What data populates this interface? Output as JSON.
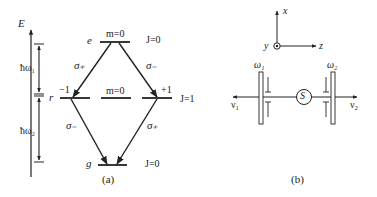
{
  "panel_a": {
    "energy_axis_label": "E",
    "interval_upper_label": "ħω₁",
    "interval_lower_label": "ħω₂",
    "level_e": {
      "name": "e",
      "m_label": "m=0",
      "J_label": "J=0"
    },
    "level_r": {
      "name": "r",
      "m_minus_label": "−1",
      "m_zero_label": "m=0",
      "m_plus_label": "+1",
      "J_label": "J=1"
    },
    "level_g": {
      "name": "g",
      "J_label": "J=0"
    },
    "transitions": {
      "upper_left": "σ₊",
      "upper_right": "σ₋",
      "lower_left": "σ₋",
      "lower_right": "σ₊"
    },
    "caption": "(a)"
  },
  "panel_b": {
    "axes": {
      "x_label": "x",
      "y_label": "y",
      "z_label": "z"
    },
    "filter_left_label": "ω₁",
    "filter_right_label": "ω₂",
    "source_label": "S",
    "photon_left_label": "ν₁",
    "photon_right_label": "ν₂",
    "caption": "(b)"
  }
}
